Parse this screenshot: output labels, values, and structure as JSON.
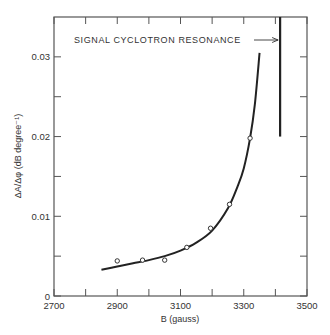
{
  "chart_data": {
    "type": "scatter",
    "title": "",
    "xlabel": "B (gauss)",
    "ylabel": "ΔA/Δφ (dB degree⁻¹)",
    "xlim": [
      2700,
      3500
    ],
    "ylim": [
      0,
      0.035
    ],
    "x_ticks": [
      2700,
      2800,
      2900,
      3000,
      3100,
      3200,
      3300,
      3400,
      3500
    ],
    "x_tick_labels": [
      "2700",
      "2900",
      "3100",
      "3300",
      "3500"
    ],
    "y_ticks": [
      0,
      0.005,
      0.01,
      0.015,
      0.02,
      0.025,
      0.03
    ],
    "y_tick_labels": [
      "0",
      "0.01",
      "0.02",
      "0.03"
    ],
    "grid": false,
    "legend": null,
    "series": [
      {
        "name": "measured",
        "style": "open-circle",
        "points": [
          {
            "x": 2900,
            "y": 0.0044
          },
          {
            "x": 2980,
            "y": 0.0045
          },
          {
            "x": 3050,
            "y": 0.0045
          },
          {
            "x": 3120,
            "y": 0.0061
          },
          {
            "x": 3195,
            "y": 0.0085
          },
          {
            "x": 3255,
            "y": 0.0115
          },
          {
            "x": 3320,
            "y": 0.0198
          }
        ]
      },
      {
        "name": "theory",
        "style": "solid-line",
        "points": [
          {
            "x": 2850,
            "y": 0.0033
          },
          {
            "x": 2900,
            "y": 0.0037
          },
          {
            "x": 2950,
            "y": 0.0041
          },
          {
            "x": 3000,
            "y": 0.0045
          },
          {
            "x": 3050,
            "y": 0.005
          },
          {
            "x": 3100,
            "y": 0.0057
          },
          {
            "x": 3150,
            "y": 0.0067
          },
          {
            "x": 3200,
            "y": 0.0082
          },
          {
            "x": 3250,
            "y": 0.011
          },
          {
            "x": 3280,
            "y": 0.0137
          },
          {
            "x": 3300,
            "y": 0.016
          },
          {
            "x": 3320,
            "y": 0.0198
          },
          {
            "x": 3335,
            "y": 0.024
          },
          {
            "x": 3350,
            "y": 0.0305
          }
        ]
      }
    ],
    "annotations": [
      {
        "text": "SIGNAL CYCLOTRON RESONANCE",
        "arrow_to_x": 3415,
        "y": 0.0325
      },
      {
        "type": "vertical-line",
        "x": 3415,
        "y_from": 0.02,
        "y_to": 0.035
      }
    ]
  }
}
